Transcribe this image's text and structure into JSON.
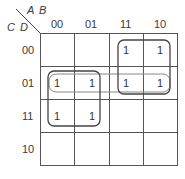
{
  "kmap": {
    "row_var": "C D",
    "col_var": "A B",
    "col_labels": [
      "00",
      "01",
      "11",
      "10"
    ],
    "row_labels": [
      "00",
      "01",
      "11",
      "10"
    ],
    "cells": [
      [
        "",
        "",
        "1",
        "1"
      ],
      [
        "1",
        "1",
        "1",
        "1"
      ],
      [
        "1",
        "1",
        "",
        ""
      ],
      [
        "",
        "",
        "",
        ""
      ]
    ],
    "groups": [
      {
        "name": "group-row01-all",
        "rows": [
          1,
          1
        ],
        "cols": [
          0,
          3
        ]
      },
      {
        "name": "group-ab-0x-cd-x1",
        "rows": [
          1,
          2
        ],
        "cols": [
          0,
          1
        ]
      },
      {
        "name": "group-a1-cd-0x",
        "rows": [
          0,
          1
        ],
        "cols": [
          2,
          3
        ]
      }
    ]
  }
}
